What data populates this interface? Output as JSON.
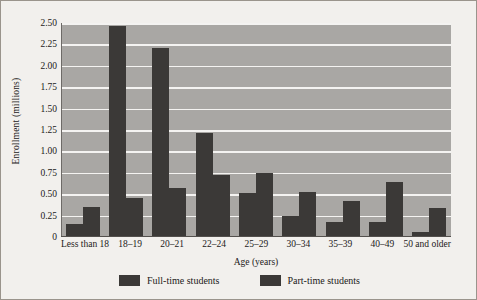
{
  "chart_data": {
    "type": "bar",
    "title": "",
    "xlabel": "Age (years)",
    "ylabel": "Enrollment (millions)",
    "ylim": [
      0,
      2.5
    ],
    "yticks": [
      "2.50",
      "2.25",
      "2.00",
      "1.75",
      "1.50",
      "1.25",
      "1.00",
      "0.75",
      "0.50",
      "0.25",
      "0"
    ],
    "ytick_values": [
      2.5,
      2.25,
      2.0,
      1.75,
      1.5,
      1.25,
      1.0,
      0.75,
      0.5,
      0.25,
      0
    ],
    "grid": true,
    "legend_position": "bottom",
    "categories": [
      "Less than 18",
      "18–19",
      "20–21",
      "22–24",
      "25–29",
      "30–34",
      "35–39",
      "40–49",
      "50 and older"
    ],
    "series": [
      {
        "name": "Full-time students",
        "color": "#3b3937",
        "values": [
          0.15,
          2.47,
          2.21,
          1.21,
          0.52,
          0.25,
          0.17,
          0.18,
          0.06
        ]
      },
      {
        "name": "Part-time students",
        "color": "#3b3937",
        "values": [
          0.35,
          0.45,
          0.57,
          0.73,
          0.75,
          0.53,
          0.42,
          0.64,
          0.34
        ]
      }
    ],
    "plot_background": "#a9a7a4",
    "gridline_color": "#f4f3f1",
    "figure_background": "#f2f0ed"
  },
  "legend": {
    "entries": [
      {
        "label": "Full-time students"
      },
      {
        "label": "Part-time students"
      }
    ]
  }
}
